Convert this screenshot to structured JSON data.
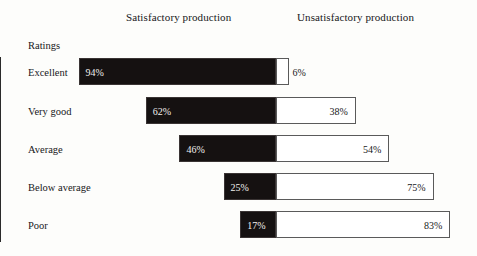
{
  "headers": {
    "left": "Satisfactory production",
    "right": "Unsatisfactory production"
  },
  "axis_title": "Ratings",
  "colors": {
    "satisfactory_bar": "#151111",
    "unsatisfactory_bar": "#ffffff",
    "unsatisfactory_border": "#5a5a5a",
    "text": "#17171a",
    "background": "#fdfdfb"
  },
  "chart_data": {
    "type": "bar",
    "title": "",
    "subtype": "diverging-stacked-100",
    "categories": [
      "Excellent",
      "Very good",
      "Average",
      "Below average",
      "Poor"
    ],
    "xlabel": "",
    "ylabel": "Ratings",
    "xlim": [
      -100,
      100
    ],
    "grid": false,
    "legend_position": "top",
    "series": [
      {
        "name": "Satisfactory production",
        "values": [
          94,
          62,
          46,
          25,
          17
        ],
        "labels": [
          "94%",
          "62%",
          "46%",
          "25%",
          "17%"
        ],
        "direction": "left",
        "color": "#151111"
      },
      {
        "name": "Unsatisfactory production",
        "values": [
          6,
          38,
          54,
          75,
          83
        ],
        "labels": [
          "6%",
          "38%",
          "54%",
          "75%",
          "83%"
        ],
        "direction": "right",
        "color": "#ffffff"
      }
    ]
  },
  "rows": [
    {
      "label": "Excellent",
      "left_value": 94,
      "left_label": "94%",
      "right_value": 6,
      "right_label": "6%",
      "right_label_outside": true
    },
    {
      "label": "Very good",
      "left_value": 62,
      "left_label": "62%",
      "right_value": 38,
      "right_label": "38%",
      "right_label_outside": false
    },
    {
      "label": "Average",
      "left_value": 46,
      "left_label": "46%",
      "right_value": 54,
      "right_label": "54%",
      "right_label_outside": false
    },
    {
      "label": "Below average",
      "left_value": 25,
      "left_label": "25%",
      "right_value": 75,
      "right_label": "75%",
      "right_label_outside": false
    },
    {
      "label": "Poor",
      "left_value": 17,
      "left_label": "17%",
      "right_value": 83,
      "right_label": "83%",
      "right_label_outside": false
    }
  ]
}
